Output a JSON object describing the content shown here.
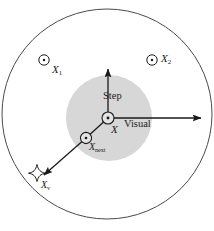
{
  "figure": {
    "background_color": "#ffffff",
    "outline_color": "#4a4a4a",
    "shaded_region_color": "#d6d6d6",
    "line_color": "#1a1a1a"
  },
  "regions": {
    "visual_field": {
      "name": "outer visual boundary circle",
      "cx": 107,
      "cy": 114,
      "r": 105
    },
    "step_region": {
      "name": "shaded step neighborhood",
      "cx": 109,
      "cy": 118,
      "r": 43
    }
  },
  "nodes": [
    {
      "id": "x1",
      "label": "X",
      "subscript": "1",
      "marker": "circle-dot",
      "cx": 44,
      "cy": 60
    },
    {
      "id": "x2",
      "label": "X",
      "subscript": "2",
      "marker": "circle-dot",
      "cx": 152,
      "cy": 60
    },
    {
      "id": "x",
      "label": "X",
      "subscript": "",
      "marker": "circle-dot",
      "cx": 108,
      "cy": 118
    },
    {
      "id": "xnext",
      "label": "X",
      "subscript": "next",
      "marker": "circle-dot",
      "cx": 86,
      "cy": 138
    },
    {
      "id": "xv",
      "label": "X",
      "subscript": "v",
      "marker": "star-4",
      "cx": 37,
      "cy": 172
    }
  ],
  "arrows": {
    "step": {
      "label": "Step",
      "from": {
        "x": 108,
        "y": 118
      },
      "to": {
        "x": 108,
        "y": 68
      },
      "direction": "up"
    },
    "visual": {
      "label": "Visual",
      "from": {
        "x": 108,
        "y": 118
      },
      "to": {
        "x": 202,
        "y": 118
      },
      "direction": "right"
    },
    "to_target": {
      "label": "",
      "from": {
        "x": 86,
        "y": 138
      },
      "to": {
        "x": 43,
        "y": 176
      },
      "direction": "down-left"
    }
  },
  "connectors": [
    {
      "name": "x-to-xnext",
      "from": {
        "x": 108,
        "y": 118
      },
      "to": {
        "x": 86,
        "y": 138
      }
    }
  ]
}
